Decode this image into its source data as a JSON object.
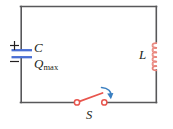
{
  "figure": {
    "name": "lc-circuit-diagram",
    "type": "circuit-schematic"
  },
  "labels": {
    "capacitor": "C",
    "charge_symbol": "Q",
    "charge_subscript": "max",
    "inductor": "L",
    "switch": "S",
    "plus_sign": "+",
    "minus_sign": "−"
  },
  "components": {
    "capacitor": {
      "name": "capacitor",
      "polarity_top": "+",
      "polarity_bottom": "−",
      "label": "C",
      "charge_label": "Qmax",
      "plate_color": "#4a6fd4",
      "plate_count": 2
    },
    "inductor": {
      "name": "inductor",
      "label": "L",
      "coil_color": "#e8837a",
      "coil_turns": 6
    },
    "switch": {
      "name": "switch",
      "label": "S",
      "state": "open",
      "contact_color": "#e8554d",
      "lever_color": "#e8554d",
      "arrow_color": "#3a7fc1",
      "arrow_meaning": "closing-direction"
    },
    "wire": {
      "name": "circuit-wire",
      "color": "#58585a"
    }
  },
  "colors": {
    "wire": "#58585a",
    "capacitor_plate": "#4a6fd4",
    "inductor": "#e8837a",
    "switch_red": "#e8554d",
    "arrow_blue": "#3a7fc1",
    "text": "#231f20",
    "background": "#ffffff"
  }
}
